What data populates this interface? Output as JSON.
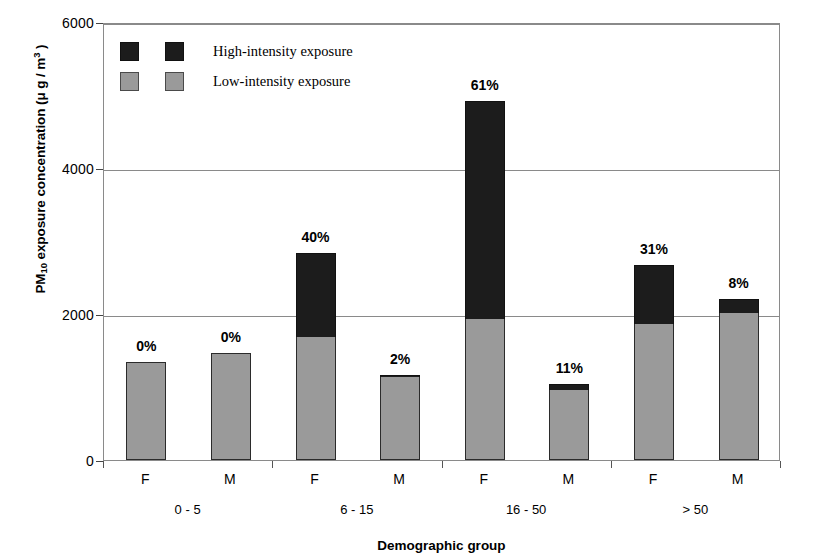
{
  "chart_data": {
    "type": "bar",
    "title": "",
    "stacked": true,
    "xlabel": "Demographic group",
    "ylabel": "PM10 exposure concentration (μ g / m3)",
    "ylim": [
      0,
      6000
    ],
    "yticks": [
      0,
      2000,
      4000,
      6000
    ],
    "ytick_labels": [
      "0",
      "2000",
      "4000",
      "6000"
    ],
    "grid": "horizontal",
    "legend_position": "top-left-inside",
    "categories": [
      "F",
      "M",
      "F",
      "M",
      "F",
      "M",
      "F",
      "M"
    ],
    "groups": [
      {
        "label": "0 - 5",
        "members": [
          "F",
          "M"
        ]
      },
      {
        "label": "6 - 15",
        "members": [
          "F",
          "M"
        ]
      },
      {
        "label": "16 - 50",
        "members": [
          "F",
          "M"
        ]
      },
      {
        "label": "> 50",
        "members": [
          "F",
          "M"
        ]
      }
    ],
    "series": [
      {
        "name": "Low-intensity exposure",
        "color": "#9a9a9a",
        "values": [
          1340,
          1470,
          1690,
          1140,
          1930,
          960,
          1860,
          2020
        ]
      },
      {
        "name": "High-intensity exposure",
        "color": "#1c1c1c",
        "values": [
          0,
          0,
          1140,
          20,
          2990,
          80,
          810,
          180
        ]
      }
    ],
    "totals": [
      1340,
      1470,
      2830,
      1160,
      4920,
      1040,
      2670,
      2200
    ],
    "annotations": [
      "0%",
      "0%",
      "40%",
      "2%",
      "61%",
      "11%",
      "31%",
      "8%"
    ]
  },
  "legend": {
    "entries": [
      {
        "label": "High-intensity exposure",
        "color": "#1c1c1c"
      },
      {
        "label": "Low-intensity exposure",
        "color": "#9a9a9a"
      }
    ]
  },
  "axes": {
    "y_title_main": "PM",
    "y_title_sub": "10",
    "y_title_mid": " exposure concentration (",
    "y_title_unit": "μ g / m",
    "y_title_sup": "3",
    "y_title_close": " )",
    "x_title": "Demographic group"
  },
  "colors": {
    "high_intensity": "#1c1c1c",
    "low_intensity": "#9a9a9a",
    "axis": "#8a8a8a",
    "background": "#ffffff"
  }
}
